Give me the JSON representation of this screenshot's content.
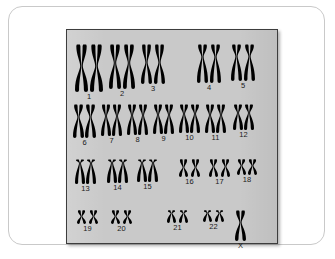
{
  "figure": {
    "kind": "karyotype",
    "panel_background_color": "#c9c9c9",
    "card_background_color": "#ffffff",
    "chromosome_color": "#000000",
    "panel_border_color": "#3d3d3d"
  },
  "karyotype": {
    "total_labels": 23,
    "rows": [
      {
        "row_index": 0,
        "top": 14,
        "groups": [
          {
            "label": "1",
            "left": 8,
            "count": 2,
            "type": "metacentric",
            "height": 48,
            "width": 13,
            "gap": 2,
            "arm_ratio": 0.46
          },
          {
            "label": "2",
            "left": 42,
            "count": 2,
            "type": "submetacentric",
            "height": 45,
            "width": 12,
            "gap": 2,
            "arm_ratio": 0.42
          },
          {
            "label": "3",
            "left": 74,
            "count": 2,
            "type": "metacentric",
            "height": 40,
            "width": 11,
            "gap": 2,
            "arm_ratio": 0.46
          },
          {
            "label": "4",
            "left": 130,
            "count": 2,
            "type": "submetacentric",
            "height": 39,
            "width": 11,
            "gap": 2,
            "arm_ratio": 0.33
          },
          {
            "label": "5",
            "left": 164,
            "count": 2,
            "type": "submetacentric",
            "height": 37,
            "width": 11,
            "gap": 2,
            "arm_ratio": 0.33
          }
        ]
      },
      {
        "row_index": 1,
        "top": 74,
        "groups": [
          {
            "label": "6",
            "left": 6,
            "count": 2,
            "type": "submetacentric",
            "height": 34,
            "width": 11,
            "gap": 1,
            "arm_ratio": 0.38
          },
          {
            "label": "7",
            "left": 34,
            "count": 2,
            "type": "submetacentric",
            "height": 32,
            "width": 10,
            "gap": 1,
            "arm_ratio": 0.38
          },
          {
            "label": "8",
            "left": 60,
            "count": 2,
            "type": "submetacentric",
            "height": 31,
            "width": 10,
            "gap": 1,
            "arm_ratio": 0.36
          },
          {
            "label": "9",
            "left": 86,
            "count": 2,
            "type": "submetacentric",
            "height": 30,
            "width": 10,
            "gap": 1,
            "arm_ratio": 0.36
          },
          {
            "label": "10",
            "left": 112,
            "count": 2,
            "type": "submetacentric",
            "height": 29,
            "width": 10,
            "gap": 1,
            "arm_ratio": 0.34
          },
          {
            "label": "11",
            "left": 138,
            "count": 2,
            "type": "submetacentric",
            "height": 29,
            "width": 10,
            "gap": 1,
            "arm_ratio": 0.38
          },
          {
            "label": "12",
            "left": 166,
            "count": 2,
            "type": "submetacentric",
            "height": 26,
            "width": 10,
            "gap": 1,
            "arm_ratio": 0.34
          }
        ]
      },
      {
        "row_index": 2,
        "top": 129,
        "groups": [
          {
            "label": "13",
            "left": 8,
            "count": 2,
            "type": "acrocentric",
            "height": 25,
            "width": 10,
            "gap": 1,
            "arm_ratio": 0.16
          },
          {
            "label": "14",
            "left": 40,
            "count": 2,
            "type": "acrocentric",
            "height": 24,
            "width": 10,
            "gap": 1,
            "arm_ratio": 0.16
          },
          {
            "label": "15",
            "left": 70,
            "count": 2,
            "type": "acrocentric",
            "height": 23,
            "width": 10,
            "gap": 1,
            "arm_ratio": 0.16
          },
          {
            "label": "16",
            "left": 112,
            "count": 2,
            "type": "metacentric",
            "height": 18,
            "width": 9,
            "gap": 3,
            "arm_ratio": 0.46
          },
          {
            "label": "17",
            "left": 142,
            "count": 2,
            "type": "metacentric",
            "height": 18,
            "width": 9,
            "gap": 3,
            "arm_ratio": 0.42
          },
          {
            "label": "18",
            "left": 170,
            "count": 2,
            "type": "metacentric",
            "height": 16,
            "width": 9,
            "gap": 2,
            "arm_ratio": 0.42
          }
        ]
      },
      {
        "row_index": 3,
        "top": 180,
        "groups": [
          {
            "label": "19",
            "left": 10,
            "count": 2,
            "type": "metacentric",
            "height": 14,
            "width": 9,
            "gap": 3,
            "arm_ratio": 0.46
          },
          {
            "label": "20",
            "left": 44,
            "count": 2,
            "type": "metacentric",
            "height": 14,
            "width": 9,
            "gap": 3,
            "arm_ratio": 0.46
          },
          {
            "label": "21",
            "left": 100,
            "count": 2,
            "type": "acrocentric",
            "height": 13,
            "width": 9,
            "gap": 3,
            "arm_ratio": 0.24
          },
          {
            "label": "22",
            "left": 136,
            "count": 2,
            "type": "acrocentric",
            "height": 12,
            "width": 9,
            "gap": 3,
            "arm_ratio": 0.24
          },
          {
            "label": "X",
            "left": 168,
            "count": 1,
            "type": "submetacentric",
            "height": 31,
            "width": 11,
            "gap": 0,
            "arm_ratio": 0.4
          }
        ]
      }
    ]
  }
}
